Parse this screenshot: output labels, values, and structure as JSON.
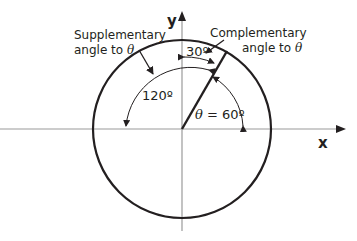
{
  "diagram": {
    "axes": {
      "x_label": "x",
      "y_label": "y"
    },
    "circle": {
      "description": "circle centered at origin"
    },
    "radius_line": {
      "angle_deg": 60
    },
    "labels": {
      "supplementary_line1": "Supplementary",
      "supplementary_line2_prefix": "angle to ",
      "theta_symbol": "θ",
      "complementary_line1": "Complementary",
      "complementary_line2_prefix": "angle to ",
      "angle_120": "120º",
      "angle_30": "30º",
      "theta_eq_prefix": " = 60º"
    }
  }
}
